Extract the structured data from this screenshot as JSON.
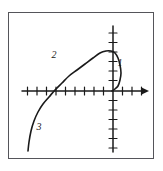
{
  "figure": {
    "kind": "coordinate-plane-curve-sketch",
    "frame_color": "#55555a",
    "ink_color": "#1a1a1a",
    "background_color": "#ffffff",
    "labels": [
      {
        "text": "1",
        "x": 120,
        "y": 66
      },
      {
        "text": "2",
        "x": 54,
        "y": 58
      },
      {
        "text": "3",
        "x": 39,
        "y": 130
      }
    ]
  },
  "chart_data": {
    "type": "line",
    "title": "",
    "subtitle": "",
    "xlabel": "",
    "ylabel": "",
    "grid": false,
    "legend_position": "none",
    "axes": {
      "x_axis": {
        "y_pixel": 91,
        "x_start_pixel": 22,
        "x_end_pixel": 148,
        "arrow_at": "positive-x",
        "tick_count_negative": 7,
        "tick_count_positive": 4,
        "tick_spacing_pixels": 9.5,
        "tick_half_length_pixels": 4
      },
      "y_axis": {
        "x_pixel": 113,
        "y_top_pixel": 26,
        "y_bottom_pixel": 152,
        "arrow_at": "none",
        "tick_count_above": 6,
        "tick_count_below": 6,
        "tick_spacing_pixels": 9.5,
        "tick_half_length_pixels": 4
      },
      "origin_pixel": {
        "x": 113,
        "y": 91
      },
      "xlim": [
        -9.6,
        3.7
      ],
      "ylim": [
        -6.4,
        6.8
      ]
    },
    "curve": {
      "name": "parametric-arc",
      "stroke_color": "#1a1a1a",
      "stroke_width": 1.6,
      "path_points_pixels": [
        {
          "x": 28,
          "y": 151
        },
        {
          "x": 29,
          "y": 142
        },
        {
          "x": 31,
          "y": 131
        },
        {
          "x": 34,
          "y": 121
        },
        {
          "x": 38,
          "y": 112
        },
        {
          "x": 43,
          "y": 104
        },
        {
          "x": 49,
          "y": 97
        },
        {
          "x": 55,
          "y": 90
        },
        {
          "x": 62,
          "y": 83
        },
        {
          "x": 69,
          "y": 76
        },
        {
          "x": 77,
          "y": 70
        },
        {
          "x": 85,
          "y": 64
        },
        {
          "x": 93,
          "y": 58
        },
        {
          "x": 100,
          "y": 53
        },
        {
          "x": 106,
          "y": 51
        },
        {
          "x": 111,
          "y": 51
        },
        {
          "x": 115,
          "y": 53
        },
        {
          "x": 118,
          "y": 58
        },
        {
          "x": 120,
          "y": 65
        },
        {
          "x": 121,
          "y": 73
        },
        {
          "x": 120,
          "y": 80
        },
        {
          "x": 118,
          "y": 86
        },
        {
          "x": 115,
          "y": 89
        },
        {
          "x": 112,
          "y": 91
        }
      ],
      "annotated_points": [
        {
          "label": "1",
          "pixel": {
            "x": 117,
            "y": 72
          }
        },
        {
          "label": "2",
          "pixel": {
            "x": 62,
            "y": 66
          }
        },
        {
          "label": "3",
          "pixel": {
            "x": 30,
            "y": 136
          }
        }
      ],
      "x_axis_crossings_pixels": [
        {
          "x": 50,
          "y": 91
        },
        {
          "x": 120,
          "y": 91
        }
      ]
    }
  }
}
